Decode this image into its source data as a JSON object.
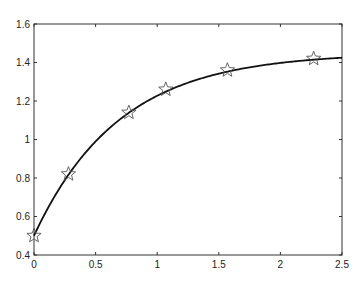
{
  "chart_data": {
    "type": "line",
    "title": "",
    "xlabel": "",
    "ylabel": "",
    "xlim": [
      0,
      2.5
    ],
    "ylim": [
      0.4,
      1.6
    ],
    "grid": false,
    "legend": null,
    "x_ticks": [
      "0",
      "0.5",
      "1",
      "1.5",
      "2",
      "2.5"
    ],
    "y_ticks": [
      "0.4",
      "0.6",
      "0.8",
      "1",
      "1.2",
      "1.4",
      "1.6"
    ],
    "series": [
      {
        "name": "fitted curve",
        "style": "solid line",
        "color": "#111111",
        "model": "y = 1.45 - 0.95*exp(-1.45*x)",
        "x": [
          0,
          0.25,
          0.5,
          0.75,
          1.0,
          1.25,
          1.5,
          1.75,
          2.0,
          2.25,
          2.5
        ],
        "y": [
          0.5,
          0.78,
          0.99,
          1.14,
          1.23,
          1.3,
          1.36,
          1.39,
          1.41,
          1.43,
          1.44
        ]
      },
      {
        "name": "data points",
        "style": "star markers",
        "color": "#555555",
        "x": [
          0,
          0.28,
          0.77,
          1.07,
          1.57,
          2.27
        ],
        "y": [
          0.5,
          0.82,
          1.14,
          1.26,
          1.36,
          1.42
        ]
      }
    ]
  }
}
